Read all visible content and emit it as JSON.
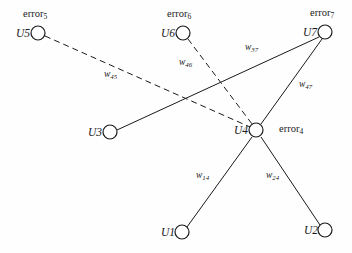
{
  "figure": {
    "kind": "node-link-diagram",
    "background_color": "#fefefe",
    "stroke_color": "#1a1a1a",
    "node_radius": 7,
    "node_fill": "#ffffff"
  },
  "nodes": [
    {
      "id": "U1",
      "label": "U1",
      "cx": 182,
      "cy": 232,
      "label_x": 161,
      "label_y": 227
    },
    {
      "id": "U2",
      "label": "U2",
      "cx": 325,
      "cy": 230,
      "label_x": 304,
      "label_y": 225
    },
    {
      "id": "U3",
      "label": "U3",
      "cx": 110,
      "cy": 132,
      "label_x": 88,
      "label_y": 127
    },
    {
      "id": "U4",
      "label": "U4",
      "cx": 256,
      "cy": 130,
      "label_x": 234,
      "label_y": 125
    },
    {
      "id": "U5",
      "label": "U5",
      "cx": 38,
      "cy": 33,
      "label_x": 16,
      "label_y": 28
    },
    {
      "id": "U6",
      "label": "U6",
      "cx": 183,
      "cy": 33,
      "label_x": 161,
      "label_y": 28
    },
    {
      "id": "U7",
      "label": "U7",
      "cx": 325,
      "cy": 32,
      "label_x": 303,
      "label_y": 27
    }
  ],
  "error_labels": [
    {
      "id": "error4",
      "text": "error",
      "subscript": "4",
      "x": 279,
      "y": 124
    },
    {
      "id": "error5",
      "text": "error",
      "subscript": "5",
      "x": 23,
      "y": 9
    },
    {
      "id": "error6",
      "text": "error",
      "subscript": "6",
      "x": 167,
      "y": 9
    },
    {
      "id": "error7",
      "text": "error",
      "subscript": "7",
      "x": 310,
      "y": 8
    }
  ],
  "edges": [
    {
      "id": "e-u1-u4",
      "from": "U1",
      "to": "U4",
      "style": "solid",
      "x1": 187,
      "y1": 227,
      "x2": 252,
      "y2": 137
    },
    {
      "id": "e-u2-u4",
      "from": "U2",
      "to": "U4",
      "style": "solid",
      "x1": 320,
      "y1": 225,
      "x2": 261,
      "y2": 137
    },
    {
      "id": "e-u3-u7",
      "from": "U3",
      "to": "U7",
      "style": "solid",
      "x1": 117,
      "y1": 130,
      "x2": 319,
      "y2": 37
    },
    {
      "id": "e-u4-u7",
      "from": "U4",
      "to": "U7",
      "style": "solid",
      "x1": 261,
      "y1": 124,
      "x2": 322,
      "y2": 39
    },
    {
      "id": "e-u5-u4",
      "from": "U5",
      "to": "U4",
      "style": "dashed",
      "x1": 45,
      "y1": 36,
      "x2": 250,
      "y2": 127
    },
    {
      "id": "e-u6-u4",
      "from": "U6",
      "to": "U4",
      "style": "dashed",
      "x1": 188,
      "y1": 39,
      "x2": 252,
      "y2": 124
    }
  ],
  "weights": [
    {
      "id": "w45",
      "text": "w",
      "subscript": "45",
      "edge": "e-u5-u4",
      "x": 104,
      "y": 70
    },
    {
      "id": "w46",
      "text": "w",
      "subscript": "46",
      "edge": "e-u6-u4",
      "x": 179,
      "y": 58
    },
    {
      "id": "w37",
      "text": "w",
      "subscript": "37",
      "edge": "e-u3-u7",
      "x": 245,
      "y": 43
    },
    {
      "id": "w47",
      "text": "w",
      "subscript": "47",
      "edge": "e-u4-u7",
      "x": 299,
      "y": 80
    },
    {
      "id": "w14",
      "text": "w",
      "subscript": "14",
      "edge": "e-u1-u4",
      "x": 196,
      "y": 171
    },
    {
      "id": "w24",
      "text": "w",
      "subscript": "24",
      "edge": "e-u2-u4",
      "x": 266,
      "y": 171
    }
  ]
}
